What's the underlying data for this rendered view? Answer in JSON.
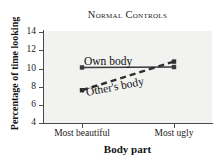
{
  "chart_data": {
    "type": "line",
    "title": "Normal Controls",
    "xlabel": "Body part",
    "ylabel": "Percentage of time looking",
    "categories": [
      "Most beautiful",
      "Most ugly"
    ],
    "x_tick_labels": [
      "Most beautiful",
      "Most ugly"
    ],
    "y_tick_labels": [
      "4",
      "6",
      "8",
      "10",
      "12",
      "14"
    ],
    "y_ticks": [
      4,
      6,
      8,
      10,
      12,
      14
    ],
    "ylim": [
      4,
      14
    ],
    "grid": false,
    "legend_position": "inline-labels",
    "series": [
      {
        "name": "Own body",
        "label": "Own body",
        "style": "solid",
        "color": "#3a3a3a",
        "marker": "square",
        "values": [
          10.1,
          10.15
        ]
      },
      {
        "name": "Other's body",
        "label": "Other's body",
        "style": "dashed",
        "color": "#2e2e2e",
        "marker": "square",
        "values": [
          7.6,
          10.75
        ]
      }
    ]
  },
  "figure": {
    "background_color": "#ffffff",
    "plot_background_color": "#f2f2f0",
    "axis_color": "#4a4a4a"
  }
}
